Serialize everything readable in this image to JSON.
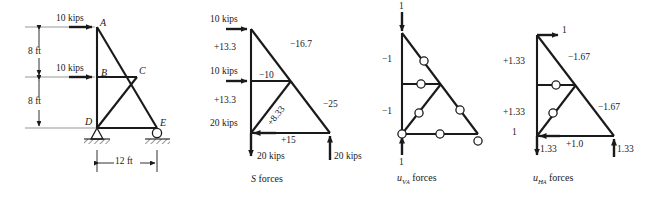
{
  "figure": {
    "units": "kips",
    "line_color": "#1a1a1a"
  },
  "panels": [
    {
      "id": "geometry",
      "caption": "",
      "nodes": [
        {
          "name": "A",
          "label": "A",
          "x": 97,
          "y": 27
        },
        {
          "name": "B",
          "label": "B",
          "x": 97,
          "y": 77
        },
        {
          "name": "C",
          "label": "C",
          "x": 137,
          "y": 77
        },
        {
          "name": "D",
          "label": "D",
          "x": 97,
          "y": 128
        },
        {
          "name": "E",
          "label": "E",
          "x": 157,
          "y": 128
        }
      ],
      "loads": [
        {
          "label": "10 kips",
          "at": "A",
          "direction": "right"
        },
        {
          "label": "10 kips",
          "at": "B",
          "direction": "right"
        }
      ],
      "dimensions": [
        {
          "label": "8 ft",
          "orientation": "vertical"
        },
        {
          "label": "8 ft",
          "orientation": "vertical"
        },
        {
          "label": "12 ft",
          "orientation": "horizontal"
        }
      ],
      "supports": [
        {
          "at": "D",
          "type": "pin"
        },
        {
          "at": "E",
          "type": "roller"
        }
      ]
    },
    {
      "id": "s-forces",
      "caption_prefix": "S",
      "caption_suffix": " forces",
      "member_forces": [
        {
          "member": "AB",
          "label": "+13.3"
        },
        {
          "member": "AC",
          "label": "−16.7"
        },
        {
          "member": "BC",
          "label": "−10"
        },
        {
          "member": "BD",
          "label": "+13.3"
        },
        {
          "member": "DC",
          "label": "+8.33"
        },
        {
          "member": "CE",
          "label": "−25"
        },
        {
          "member": "DE",
          "label": "+15"
        }
      ],
      "loads": [
        {
          "label": "10 kips",
          "at": "A",
          "direction": "right"
        },
        {
          "label": "10 kips",
          "at": "B",
          "direction": "right"
        },
        {
          "label": "20 kips",
          "at": "D",
          "direction": "left"
        },
        {
          "label": "20 kips",
          "at": "D",
          "direction": "down"
        },
        {
          "label": "20 kips",
          "at": "E",
          "direction": "up"
        }
      ]
    },
    {
      "id": "uva-forces",
      "caption_prefix": "u",
      "caption_sub": "V",
      "caption_subsub": "A",
      "caption_suffix": " forces",
      "member_forces": [
        {
          "member": "AB",
          "label": "−1"
        },
        {
          "member": "AC",
          "label": "0"
        },
        {
          "member": "BC",
          "label": "0"
        },
        {
          "member": "BD",
          "label": "−1"
        },
        {
          "member": "DC",
          "label": "0"
        },
        {
          "member": "CE",
          "label": "0"
        },
        {
          "member": "DE",
          "label": "0"
        },
        {
          "member": "D-left",
          "label": "0"
        },
        {
          "member": "E-react",
          "label": "0"
        }
      ],
      "loads": [
        {
          "label": "1",
          "at": "A",
          "direction": "down"
        },
        {
          "label": "1",
          "at": "D",
          "direction": "up"
        }
      ]
    },
    {
      "id": "uha-forces",
      "caption_prefix": "u",
      "caption_sub": "H",
      "caption_subsub": "A",
      "caption_suffix": " forces",
      "member_forces": [
        {
          "member": "AB",
          "label": "+1.33"
        },
        {
          "member": "AC",
          "label": "−1.67"
        },
        {
          "member": "BC",
          "label": "0"
        },
        {
          "member": "BD",
          "label": "+1.33"
        },
        {
          "member": "DC",
          "label": "0"
        },
        {
          "member": "CE",
          "label": "−1.67"
        },
        {
          "member": "DE",
          "label": "+1.0"
        }
      ],
      "loads": [
        {
          "label": "1",
          "at": "A",
          "direction": "right"
        },
        {
          "label": "1",
          "at": "D",
          "direction": "left"
        },
        {
          "label": "1.33",
          "at": "D",
          "direction": "down"
        },
        {
          "label": "1.33",
          "at": "E",
          "direction": "up"
        }
      ]
    }
  ],
  "text": {
    "kips10_a1": "10 kips",
    "kips10_b1": "10 kips",
    "nodeA": "A",
    "nodeB": "B",
    "nodeC": "C",
    "nodeD": "D",
    "nodeE": "E",
    "dim8a": "8 ft",
    "dim8b": "8 ft",
    "dim12": "12 ft",
    "s_kips10_a": "10 kips",
    "s_kips10_b": "10 kips",
    "s_kips20_left": "20 kips",
    "s_kips20_down": "20 kips",
    "s_kips20_up": "20 kips",
    "s_ab": "+13.3",
    "s_ac": "−16.7",
    "s_bc": "−10",
    "s_bd": "+13.3",
    "s_dc": "+8.33",
    "s_ce": "−25",
    "s_de": "+15",
    "s_caption_prefix": "S",
    "s_caption_suffix": "forces",
    "uv_top": "1",
    "uv_bottom": "1",
    "uv_ab": "−1",
    "uv_bd": "−1",
    "uv_zero_ac": "0",
    "uv_zero_bc": "0",
    "uv_zero_dc": "0",
    "uv_zero_ce": "0",
    "uv_zero_de": "0",
    "uv_zero_d": "0",
    "uv_zero_e": "0",
    "uv_caption_prefix": "u",
    "uv_caption_sub": "V",
    "uv_caption_subsub": "A",
    "uv_caption_suffix": "forces",
    "uh_top": "1",
    "uh_left": "1",
    "uh_ab": "+1.33",
    "uh_bd": "+1.33",
    "uh_ac": "−1.67",
    "uh_ce": "−1.67",
    "uh_de": "+1.0",
    "uh_zero_bc": "0",
    "uh_zero_dc": "0",
    "uh_d_down": "1.33",
    "uh_e_up": "1.33",
    "uh_caption_prefix": "u",
    "uh_caption_sub": "H",
    "uh_caption_subsub": "A",
    "uh_caption_suffix": "forces"
  }
}
